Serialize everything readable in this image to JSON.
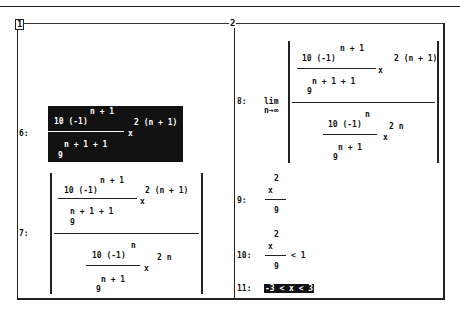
{
  "window": {
    "left_pane_number": "1",
    "right_pane_number": "2"
  },
  "expressions": [
    {
      "label": "6:",
      "highlighted": true,
      "numerator_base": "10 (-1)",
      "numerator_exp": "n + 1",
      "denominator_base": "9",
      "denominator_exp": "n + 1 + 1",
      "x": "x",
      "x_exp": "2 (n + 1)"
    },
    {
      "label": "7:",
      "abs_value": true,
      "top": {
        "numerator_base": "10 (-1)",
        "numerator_exp": "n + 1",
        "denominator_base": "9",
        "denominator_exp": "n + 1 + 1",
        "x": "x",
        "x_exp": "2 (n + 1)"
      },
      "bottom": {
        "numerator_base": "10 (-1)",
        "numerator_exp": "n",
        "denominator_base": "9",
        "denominator_exp": "n + 1",
        "x": "x",
        "x_exp": "2 n"
      }
    },
    {
      "label": "8:",
      "limit": "lim",
      "limit_sub": "n→∞",
      "top": {
        "numerator_base": "10 (-1)",
        "numerator_exp": "n + 1",
        "denominator_base": "9",
        "denominator_exp": "n + 1 + 1",
        "x": "x",
        "x_exp": "2 (n + 1)"
      },
      "bottom": {
        "numerator_base": "10 (-1)",
        "numerator_exp": "n",
        "denominator_base": "9",
        "denominator_exp": "n + 1",
        "x": "x",
        "x_exp": "2 n"
      }
    },
    {
      "label": "9:",
      "numerator": "x",
      "numerator_exp": "2",
      "denominator": "9"
    },
    {
      "label": "10:",
      "numerator": "x",
      "numerator_exp": "2",
      "denominator": "9",
      "relation": "< 1"
    },
    {
      "label": "11:",
      "highlighted": true,
      "text": "-3 < x < 3"
    }
  ]
}
